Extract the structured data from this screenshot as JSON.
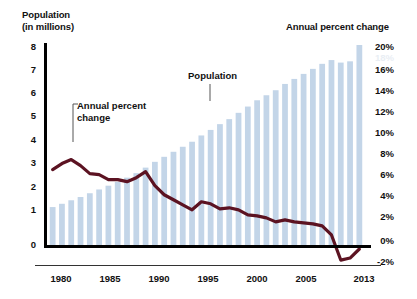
{
  "left_axis": {
    "title": "Population\n(in millions)",
    "ticks": [
      "8",
      "7",
      "6",
      "5",
      "4",
      "3",
      "2",
      "1",
      "0"
    ]
  },
  "right_axis": {
    "title": "Annual percent change",
    "ticks": [
      "20%",
      "18%",
      "16%",
      "14%",
      "12%",
      "10%",
      "8%",
      "6%",
      "4%",
      "2%",
      "0%",
      "-2%"
    ]
  },
  "x_axis": {
    "ticks": [
      "1980",
      "1985",
      "1990",
      "1995",
      "2000",
      "2005",
      "2013"
    ]
  },
  "annotations": {
    "annual_percent_change": "Annual percent\nchange",
    "population": "Population"
  },
  "colors": {
    "bar": "#c3d5e8",
    "line": "#5c1322",
    "axis": "#000000",
    "text": "#111111",
    "background": "#ffffff"
  },
  "chart_data": {
    "type": "bar",
    "title": "",
    "subtitle": "",
    "xlabel": "",
    "ylabel": "Population (in millions)",
    "y2label": "Annual percent change",
    "grid": false,
    "legend": "annotations",
    "ylim": [
      0,
      8
    ],
    "y2lim": [
      -2,
      20
    ],
    "xlim": [
      1980,
      2013
    ],
    "categories": [
      "1980",
      "1981",
      "1982",
      "1983",
      "1984",
      "1985",
      "1986",
      "1987",
      "1988",
      "1989",
      "1990",
      "1991",
      "1992",
      "1993",
      "1994",
      "1995",
      "1996",
      "1997",
      "1998",
      "1999",
      "2000",
      "2001",
      "2002",
      "2003",
      "2004",
      "2005",
      "2006",
      "2007",
      "2008",
      "2009",
      "2010",
      "2011",
      "2012",
      "2013"
    ],
    "series": [
      {
        "name": "Population",
        "type": "bar",
        "axis": "left",
        "unit": "millions",
        "color": "#c3d5e8",
        "values": [
          1.55,
          1.68,
          1.82,
          1.95,
          2.1,
          2.25,
          2.4,
          2.55,
          2.72,
          2.9,
          3.12,
          3.35,
          3.55,
          3.75,
          3.95,
          4.15,
          4.4,
          4.62,
          4.85,
          5.05,
          5.3,
          5.55,
          5.8,
          6.0,
          6.2,
          6.45,
          6.65,
          6.85,
          7.05,
          7.25,
          7.4,
          7.3,
          7.35,
          8.0
        ]
      },
      {
        "name": "Annual percent change",
        "type": "line",
        "axis": "right",
        "unit": "percent",
        "color": "#5c1322",
        "values": [
          7.6,
          8.2,
          8.6,
          8.0,
          7.2,
          7.1,
          6.6,
          6.6,
          6.4,
          6.8,
          7.4,
          6.0,
          5.1,
          4.6,
          4.1,
          3.6,
          4.4,
          4.2,
          3.7,
          3.8,
          3.6,
          3.1,
          3.0,
          2.8,
          2.4,
          2.6,
          2.4,
          2.3,
          2.2,
          2.0,
          1.1,
          -1.4,
          -1.2,
          -0.3
        ]
      }
    ]
  }
}
